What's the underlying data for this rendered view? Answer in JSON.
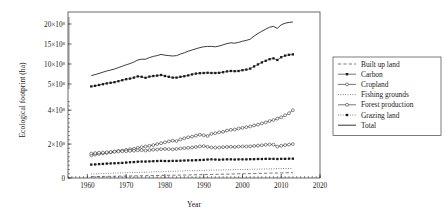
{
  "chart_data": {
    "type": "line",
    "title": "",
    "xlabel": "Year",
    "ylabel": "Ecological footprint (ha)",
    "xlim": [
      1955,
      2020
    ],
    "xticks": [
      1960,
      1970,
      1980,
      1990,
      2000,
      2010,
      2020
    ],
    "xticklabels": [
      "1960",
      "1970",
      "1980",
      "1990",
      "2000",
      "2010",
      "2020"
    ],
    "broken_axis": true,
    "upper_panel": {
      "ylim": [
        3.5,
        22
      ],
      "yticks": [
        5,
        10,
        15,
        20
      ],
      "yticklabels": [
        "5×10",
        "10×10",
        "15×10",
        "20×10"
      ],
      "exponent": "8"
    },
    "lower_panel": {
      "ylim": [
        0,
        4.6
      ],
      "yticks": [
        0,
        2,
        4
      ],
      "yticklabels": [
        "0",
        "2×10",
        "4×10"
      ],
      "exponent": "8"
    },
    "units_note": "values in 10^8 ha",
    "grid": false,
    "legend_position": "right-outside",
    "x": [
      1961,
      1962,
      1963,
      1964,
      1965,
      1966,
      1967,
      1968,
      1969,
      1970,
      1971,
      1972,
      1973,
      1974,
      1975,
      1976,
      1977,
      1978,
      1979,
      1980,
      1981,
      1982,
      1983,
      1984,
      1985,
      1986,
      1987,
      1988,
      1989,
      1990,
      1991,
      1992,
      1993,
      1994,
      1995,
      1996,
      1997,
      1998,
      1999,
      2000,
      2001,
      2002,
      2003,
      2004,
      2005,
      2006,
      2007,
      2008,
      2009,
      2010,
      2011,
      2012,
      2013
    ],
    "series": [
      {
        "name": "Built up land",
        "style": "dashed",
        "marker": "none",
        "panel": "lower",
        "values": [
          0.08,
          0.085,
          0.09,
          0.093,
          0.097,
          0.1,
          0.104,
          0.108,
          0.112,
          0.116,
          0.12,
          0.124,
          0.128,
          0.132,
          0.136,
          0.14,
          0.144,
          0.148,
          0.152,
          0.156,
          0.16,
          0.164,
          0.168,
          0.172,
          0.176,
          0.18,
          0.185,
          0.19,
          0.195,
          0.2,
          0.205,
          0.21,
          0.215,
          0.22,
          0.225,
          0.23,
          0.235,
          0.24,
          0.245,
          0.25,
          0.255,
          0.26,
          0.265,
          0.27,
          0.275,
          0.28,
          0.285,
          0.29,
          0.295,
          0.3,
          0.305,
          0.31,
          0.315
        ]
      },
      {
        "name": "Carbon",
        "style": "solid",
        "marker": "filled-square",
        "panel": "upper",
        "values": [
          4.4,
          4.55,
          4.75,
          4.95,
          5.15,
          5.3,
          5.45,
          5.7,
          5.95,
          6.2,
          6.35,
          6.6,
          6.9,
          6.8,
          6.55,
          6.85,
          7.0,
          7.1,
          7.25,
          7.0,
          6.8,
          6.6,
          6.6,
          6.8,
          6.95,
          7.15,
          7.4,
          7.6,
          7.7,
          7.75,
          7.8,
          7.75,
          7.75,
          7.8,
          7.95,
          8.15,
          8.25,
          8.2,
          8.25,
          8.45,
          8.6,
          8.85,
          9.4,
          9.9,
          10.4,
          10.8,
          11.2,
          11.4,
          11.0,
          11.7,
          12.1,
          12.3,
          12.4
        ]
      },
      {
        "name": "Cropland",
        "style": "solid",
        "marker": "open-circle",
        "panel": "lower",
        "values": [
          1.33,
          1.38,
          1.42,
          1.45,
          1.48,
          1.52,
          1.56,
          1.6,
          1.62,
          1.66,
          1.7,
          1.72,
          1.78,
          1.82,
          1.86,
          1.9,
          1.94,
          2.0,
          2.05,
          2.1,
          2.16,
          2.2,
          2.18,
          2.28,
          2.34,
          2.4,
          2.44,
          2.5,
          2.55,
          2.52,
          2.48,
          2.6,
          2.64,
          2.7,
          2.72,
          2.8,
          2.84,
          2.86,
          2.92,
          2.96,
          3.0,
          3.04,
          3.1,
          3.15,
          3.22,
          3.28,
          3.36,
          3.42,
          3.5,
          3.58,
          3.7,
          3.82,
          4.0
        ]
      },
      {
        "name": "Fishing grounds",
        "style": "dotted",
        "marker": "none",
        "panel": "lower",
        "values": [
          0.23,
          0.24,
          0.25,
          0.26,
          0.27,
          0.28,
          0.29,
          0.3,
          0.3,
          0.31,
          0.32,
          0.32,
          0.33,
          0.34,
          0.34,
          0.35,
          0.36,
          0.37,
          0.37,
          0.38,
          0.39,
          0.4,
          0.4,
          0.41,
          0.42,
          0.43,
          0.43,
          0.44,
          0.45,
          0.45,
          0.46,
          0.46,
          0.47,
          0.47,
          0.48,
          0.48,
          0.49,
          0.49,
          0.5,
          0.5,
          0.51,
          0.51,
          0.52,
          0.52,
          0.53,
          0.53,
          0.54,
          0.54,
          0.55,
          0.55,
          0.56,
          0.56,
          0.57
        ]
      },
      {
        "name": "Forest production",
        "style": "solid",
        "marker": "open-circle",
        "panel": "lower",
        "values": [
          1.44,
          1.47,
          1.49,
          1.5,
          1.52,
          1.53,
          1.55,
          1.56,
          1.57,
          1.58,
          1.6,
          1.61,
          1.63,
          1.64,
          1.62,
          1.65,
          1.67,
          1.68,
          1.7,
          1.71,
          1.7,
          1.69,
          1.71,
          1.74,
          1.76,
          1.78,
          1.8,
          1.83,
          1.86,
          1.88,
          1.84,
          1.8,
          1.79,
          1.8,
          1.82,
          1.83,
          1.84,
          1.83,
          1.85,
          1.86,
          1.86,
          1.87,
          1.89,
          1.91,
          1.93,
          1.96,
          1.98,
          1.97,
          1.85,
          1.9,
          1.94,
          1.97,
          2.0
        ]
      },
      {
        "name": "Grazing land",
        "style": "dotted",
        "marker": "filled-square",
        "panel": "lower",
        "values": [
          0.79,
          0.8,
          0.82,
          0.83,
          0.85,
          0.86,
          0.87,
          0.88,
          0.89,
          0.91,
          0.93,
          0.94,
          0.96,
          0.97,
          0.97,
          0.98,
          0.99,
          1.0,
          1.01,
          1.0,
          1.0,
          1.01,
          1.01,
          1.02,
          1.03,
          1.04,
          1.04,
          1.05,
          1.06,
          1.07,
          1.09,
          1.1,
          1.09,
          1.08,
          1.09,
          1.1,
          1.1,
          1.09,
          1.1,
          1.1,
          1.1,
          1.11,
          1.11,
          1.12,
          1.12,
          1.13,
          1.13,
          1.13,
          1.12,
          1.13,
          1.13,
          1.14,
          1.14
        ]
      },
      {
        "name": "Total",
        "style": "solid",
        "marker": "none",
        "panel": "upper",
        "values": [
          7.1,
          7.35,
          7.65,
          7.95,
          8.25,
          8.5,
          8.75,
          9.1,
          9.45,
          9.8,
          10.1,
          10.5,
          11.0,
          11.2,
          11.2,
          11.6,
          11.9,
          12.1,
          12.4,
          12.2,
          12.1,
          12.0,
          12.1,
          12.5,
          12.8,
          13.2,
          13.5,
          13.8,
          14.1,
          14.3,
          14.4,
          14.4,
          14.3,
          14.5,
          14.8,
          15.1,
          15.3,
          15.2,
          15.4,
          15.7,
          15.9,
          16.2,
          17.0,
          17.6,
          18.2,
          18.7,
          19.2,
          19.4,
          18.9,
          19.8,
          20.2,
          20.4,
          20.5
        ]
      }
    ]
  },
  "legend": {
    "items": [
      {
        "label": "Built up land"
      },
      {
        "label": "Carbon"
      },
      {
        "label": "Cropland"
      },
      {
        "label": "Fishing grounds"
      },
      {
        "label": "Forest production"
      },
      {
        "label": "Grazing land"
      },
      {
        "label": "Total"
      }
    ]
  },
  "colors": {
    "line": "#1a1a1a",
    "frame": "#444444",
    "background": "#ffffff"
  }
}
